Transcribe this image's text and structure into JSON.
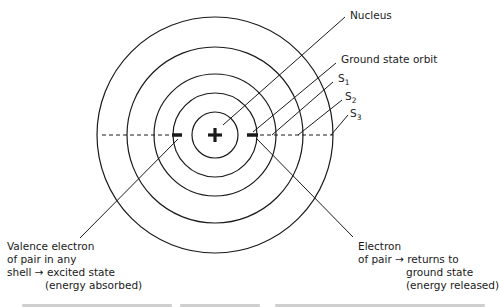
{
  "diagram": {
    "type": "atomic-shell-model",
    "labels": {
      "nucleus": "Nucleus",
      "ground_state_orbit": "Ground state orbit",
      "s1": {
        "base": "S",
        "sub": "1"
      },
      "s2": {
        "base": "S",
        "sub": "2"
      },
      "s3": {
        "base": "S",
        "sub": "3"
      },
      "valence": {
        "line1": "Valence electron",
        "line2": "of pair in any",
        "line3": "shell → excited state",
        "line4": "(energy absorbed)"
      },
      "electron": {
        "line1": "Electron",
        "line2": "of pair → returns to",
        "line3": "ground state",
        "line4": "(energy released)"
      }
    },
    "nucleus_symbol": "+",
    "electron_symbol": "−",
    "shells": [
      "ground",
      "S1",
      "S2",
      "S3",
      "outer"
    ],
    "colors": {
      "line": "#1a1a1a",
      "background": "#ffffff"
    }
  }
}
